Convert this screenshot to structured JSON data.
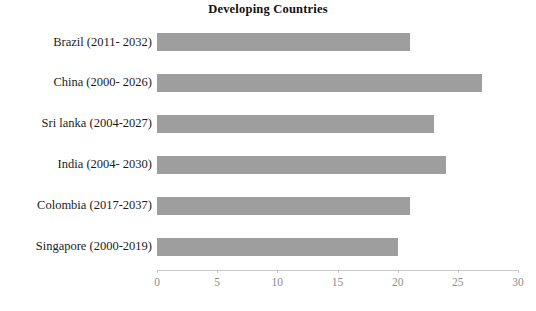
{
  "chart_data": {
    "type": "bar",
    "orientation": "horizontal",
    "title": "Developing Countries",
    "xlabel": "",
    "ylabel": "",
    "categories": [
      "Brazil (2011- 2032)",
      "China (2000- 2026)",
      "Sri lanka (2004-2027)",
      "India (2004- 2030)",
      "Colombia (2017-2037)",
      "Singapore (2000-2019)"
    ],
    "values": [
      21,
      27,
      23,
      24,
      21,
      20
    ],
    "xlim": [
      0,
      30
    ],
    "xticks": [
      0,
      5,
      10,
      15,
      20,
      25,
      30
    ],
    "xtick_labels": [
      "0",
      "5",
      "10",
      "15",
      "20",
      "25",
      "30"
    ],
    "grid": false,
    "legend": null,
    "bar_color": "#9e9e9e",
    "axis_color": "#c9c9c9",
    "tick_label_color": "#8e8e8e",
    "background": "#ffffff"
  }
}
